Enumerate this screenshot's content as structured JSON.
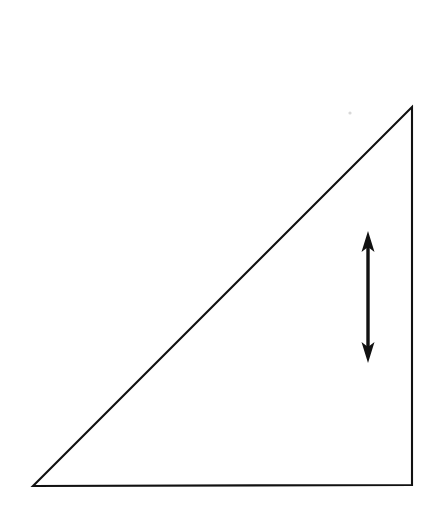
{
  "figure": {
    "title": "Right triangle with vertical double-headed arrow",
    "canvas": {
      "width": 443,
      "height": 514,
      "background_color": "#ffffff"
    },
    "stroke_color": "#111111",
    "shapes": {
      "triangle": {
        "name": "right-triangle",
        "description": "Right triangle with the right angle at the bottom-right corner",
        "vertices": [
          {
            "label": "bottom-left",
            "x": 33,
            "y": 486
          },
          {
            "label": "top-right",
            "x": 412,
            "y": 107
          },
          {
            "label": "bottom-right",
            "x": 412,
            "y": 485
          }
        ],
        "points_attr": "33,486 412,107 412,485",
        "fill": "none",
        "stroke_width": 2.1
      },
      "arrow": {
        "name": "vertical-double-arrow",
        "description": "Double-headed arrow pointing up and down, placed inside the triangle near the vertical leg",
        "shaft_x": 368,
        "top_tip_y": 231,
        "bottom_tip_y": 363,
        "shaft_stroke_width": 3.4,
        "head_half_width": 6.5,
        "head_length": 21,
        "head_barb_inset": 5,
        "up_head_path": "M 368 231 L 374.5 252 L 368 247 L 361.5 252 Z",
        "down_head_path": "M 368 363 L 361.5 342 L 368 347 L 374.5 342 Z",
        "shaft_path": "M 368 243 L 368 351"
      }
    },
    "artifacts": [
      {
        "name": "scan-speck",
        "x": 350,
        "y": 113,
        "radius": 1.6,
        "color": "#d8d8d8"
      }
    ]
  }
}
